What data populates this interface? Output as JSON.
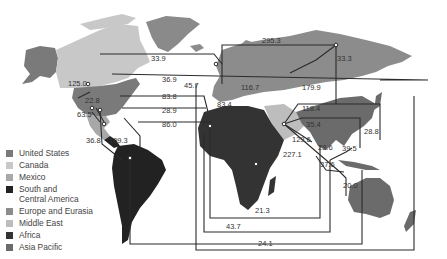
{
  "map": {
    "title": "",
    "regions": [
      {
        "id": "united-states",
        "name": "United States",
        "color": "#7a7a7a"
      },
      {
        "id": "canada",
        "name": "Canada",
        "color": "#c8c8c8"
      },
      {
        "id": "mexico",
        "name": "Mexico",
        "color": "#a8a8a8"
      },
      {
        "id": "south-central-america",
        "name": "South and\nCentral America",
        "color": "#222222"
      },
      {
        "id": "europe-eurasia",
        "name": "Europe and Eurasia",
        "color": "#8c8c8c"
      },
      {
        "id": "middle-east",
        "name": "Middle East",
        "color": "#bdbdbd"
      },
      {
        "id": "africa",
        "name": "Africa",
        "color": "#333333"
      },
      {
        "id": "asia-pacific",
        "name": "Asia Pacific",
        "color": "#6b6b6b"
      }
    ],
    "flow_labels": [
      {
        "id": "flow-295-3",
        "value": "295.3",
        "x": 262,
        "y": 43
      },
      {
        "id": "flow-33-3",
        "value": "33.3",
        "x": 337,
        "y": 61
      },
      {
        "id": "flow-33-9",
        "value": "33.9",
        "x": 151,
        "y": 61
      },
      {
        "id": "flow-125-0",
        "value": "125.0",
        "x": 68,
        "y": 86
      },
      {
        "id": "flow-36-9",
        "value": "36.9",
        "x": 162,
        "y": 82
      },
      {
        "id": "flow-45-7",
        "value": "45.7",
        "x": 184,
        "y": 88
      },
      {
        "id": "flow-116-7",
        "value": "116.7",
        "x": 241,
        "y": 90
      },
      {
        "id": "flow-179-9",
        "value": "179.9",
        "x": 302,
        "y": 90
      },
      {
        "id": "flow-22-8",
        "value": "22.8",
        "x": 85,
        "y": 103
      },
      {
        "id": "flow-83-8",
        "value": "83.8",
        "x": 162,
        "y": 99
      },
      {
        "id": "flow-83-4",
        "value": "83.4",
        "x": 217,
        "y": 107
      },
      {
        "id": "flow-118-4",
        "value": "118.4",
        "x": 302,
        "y": 111
      },
      {
        "id": "flow-63-5",
        "value": "63.5",
        "x": 77,
        "y": 117
      },
      {
        "id": "flow-28-9",
        "value": "28.9",
        "x": 162,
        "y": 113
      },
      {
        "id": "flow-86-0",
        "value": "86.0",
        "x": 162,
        "y": 127
      },
      {
        "id": "flow-35-4",
        "value": "35.4",
        "x": 306,
        "y": 127
      },
      {
        "id": "flow-28-8",
        "value": "28.8",
        "x": 364,
        "y": 134
      },
      {
        "id": "flow-36-8",
        "value": "36.8",
        "x": 86,
        "y": 143
      },
      {
        "id": "flow-109-3",
        "value": "109.3",
        "x": 109,
        "y": 143
      },
      {
        "id": "flow-129-6",
        "value": "129.6",
        "x": 292,
        "y": 142
      },
      {
        "id": "flow-227-1",
        "value": "227.1",
        "x": 283,
        "y": 157
      },
      {
        "id": "flow-28-6",
        "value": "28.6",
        "x": 318,
        "y": 150
      },
      {
        "id": "flow-39-5",
        "value": "39.5",
        "x": 342,
        "y": 151
      },
      {
        "id": "flow-37-6",
        "value": "37.6",
        "x": 320,
        "y": 167
      },
      {
        "id": "flow-20-0",
        "value": "20.0",
        "x": 343,
        "y": 188
      },
      {
        "id": "flow-21-3",
        "value": "21.3",
        "x": 255,
        "y": 213
      },
      {
        "id": "flow-43-7",
        "value": "43.7",
        "x": 226,
        "y": 229
      },
      {
        "id": "flow-24-1",
        "value": "24.1",
        "x": 258,
        "y": 246
      }
    ]
  },
  "legend": {
    "items": [
      {
        "label": "United States",
        "color": "#7a7a7a"
      },
      {
        "label": "Canada",
        "color": "#c8c8c8"
      },
      {
        "label": "Mexico",
        "color": "#a8a8a8"
      },
      {
        "label": "South and\nCentral America",
        "color": "#222222"
      },
      {
        "label": "Europe and Eurasia",
        "color": "#8c8c8c"
      },
      {
        "label": "Middle East",
        "color": "#bdbdbd"
      },
      {
        "label": "Africa",
        "color": "#333333"
      },
      {
        "label": "Asia Pacific",
        "color": "#6b6b6b"
      }
    ]
  },
  "colors": {
    "flow_line": "#2b2b2b",
    "background": "#ffffff",
    "greenland": "#8a8a8a"
  }
}
